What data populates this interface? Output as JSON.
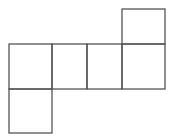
{
  "diagram": {
    "type": "cube-net",
    "stroke_color": "#555555",
    "background": "#ffffff",
    "squares": [
      {
        "id": "top",
        "x": 122,
        "y": 9,
        "w": 43,
        "h": 35
      },
      {
        "id": "row-1",
        "x": 9,
        "y": 44,
        "w": 43,
        "h": 45
      },
      {
        "id": "row-2",
        "x": 52,
        "y": 44,
        "w": 35,
        "h": 45
      },
      {
        "id": "row-3",
        "x": 87,
        "y": 44,
        "w": 35,
        "h": 45
      },
      {
        "id": "row-4",
        "x": 122,
        "y": 44,
        "w": 43,
        "h": 45
      },
      {
        "id": "bottom",
        "x": 9,
        "y": 89,
        "w": 43,
        "h": 44
      }
    ]
  }
}
